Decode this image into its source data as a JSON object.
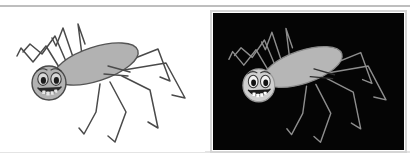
{
  "figure": {
    "width": 410,
    "height": 163,
    "background_color": "#ffffff",
    "rules": {
      "top_rule": {
        "y": 6,
        "x1": 0,
        "x2": 410,
        "color": "#a9a9a9",
        "thickness": 1.4
      },
      "bottom_rule": {
        "y": 152,
        "x1": 0,
        "x2": 410,
        "color": "#c9c9c9",
        "thickness": 1.2
      }
    },
    "panels": [
      {
        "id": "panel-left",
        "name": "spider-on-white",
        "background_color": "#ffffff",
        "x": 0,
        "y": 10,
        "width": 205,
        "height": 142,
        "has_frame": false,
        "line_color": "#4a4a4a",
        "body_fill": "#b2b2b2",
        "body_stroke": "#555555",
        "head_fill": "#b2b2b2",
        "head_stroke": "#4a4a4a",
        "eye_white": "#d8d8d8",
        "pupil_color": "#1c1c1c",
        "mouth_color": "#2a2a2a",
        "tooth_color": "#e8e8e8"
      },
      {
        "id": "panel-right",
        "name": "spider-on-black",
        "background_color": "#050505",
        "x": 213,
        "y": 13,
        "width": 191,
        "height": 137,
        "has_frame": true,
        "frame_color": "#d5d5d5",
        "frame_width": 2,
        "line_color": "#8e8e8e",
        "body_fill": "#b6b6b6",
        "body_stroke": "#8a8a8a",
        "head_fill": "#cfcfcf",
        "head_stroke": "#9a9a9a",
        "eye_white": "#f2f2f2",
        "pupil_color": "#111111",
        "mouth_color": "#1a1a1a",
        "tooth_color": "#ffffff"
      }
    ],
    "spider": {
      "abdomen": {
        "cx": 96,
        "cy": 64,
        "rx": 44,
        "ry": 17,
        "rotation_deg": -18
      },
      "head": {
        "cx": 49,
        "cy": 83,
        "r": 17
      },
      "face": {
        "left_eye": {
          "cx": 43,
          "cy": 79,
          "rx": 5.2,
          "ry": 6.4
        },
        "right_eye": {
          "cx": 56,
          "cy": 79,
          "rx": 5.2,
          "ry": 6.4
        },
        "left_pupil": {
          "cx": 43.4,
          "cy": 80.4,
          "rx": 2.6,
          "ry": 3.4
        },
        "right_pupil": {
          "cx": 56.4,
          "cy": 80.4,
          "rx": 2.6,
          "ry": 3.4
        },
        "eyebrow_left": "M 37 71 q 5 -4 10 -1",
        "eyebrow_right": "M 51 70 q 5 -3 10 1",
        "mouth": "M 38 88 q 11 12 23 -1",
        "teeth": [
          {
            "x": 42.2,
            "y": 90.4,
            "w": 3.4,
            "h": 3.6
          },
          {
            "x": 46.2,
            "y": 91.6,
            "w": 3.6,
            "h": 3.8
          },
          {
            "x": 50.4,
            "y": 91.2,
            "w": 3.4,
            "h": 3.6
          },
          {
            "x": 54.2,
            "y": 89.6,
            "w": 3.2,
            "h": 3.2
          }
        ]
      },
      "legs": [
        {
          "id": "leg-left-1",
          "path": "M 62 72 L 46 46 L 33 62 L 21 48 L 17 56"
        },
        {
          "id": "leg-left-2",
          "path": "M 68 66 L 55 36 L 42 54 L 30 44 L 23 52"
        },
        {
          "id": "leg-left-3",
          "path": "M 74 60 L 63 28 L 56 46 L 52 38"
        },
        {
          "id": "leg-left-4",
          "path": "M 82 55 L 78 24 L 85 44"
        },
        {
          "id": "leg-right-1",
          "path": "M 120 64 L 158 49 L 170 81 L 160 77"
        },
        {
          "id": "leg-right-2",
          "path": "M 124 70 L 166 63 L 185 98 L 172 95"
        },
        {
          "id": "leg-right-3",
          "path": "M 122 76 L 150 90 L 158 128 L 148 122"
        },
        {
          "id": "leg-right-4",
          "path": "M 110 82 L 126 112 L 115 142 L 108 136"
        },
        {
          "id": "leg-right-5",
          "path": "M 100 84 L 96 112 L 84 134 L 79 128"
        }
      ],
      "palps": [
        {
          "id": "palp-upper",
          "path": "M 108 66 L 130 72"
        },
        {
          "id": "palp-lower",
          "path": "M 104 74 L 128 76"
        }
      ]
    },
    "labels": {
      "panel_left_label": "",
      "panel_right_label": ""
    }
  }
}
